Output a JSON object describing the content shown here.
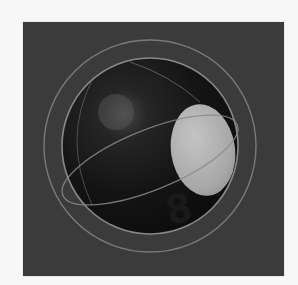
{
  "image": {
    "subject": "billiard eight ball icon",
    "ball_number": "8",
    "colors": {
      "page_background": "#f7f7f7",
      "panel_background": "#3b3b3b",
      "ball": "#111111",
      "number_disc": "#b0b0b0",
      "rings": "#8a8a8a",
      "numeral": "#1a1a1a"
    }
  }
}
